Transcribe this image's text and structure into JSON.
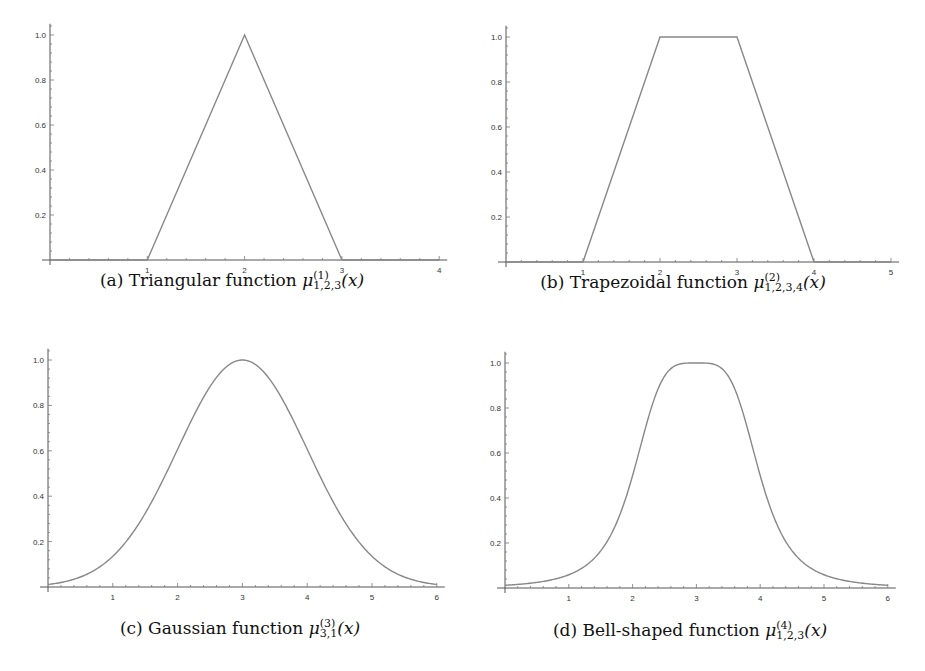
{
  "chart_data": [
    {
      "id": "a",
      "type": "line",
      "title": "Triangular function",
      "caption_prefix": "(a) Triangular function ",
      "sup": "(1)",
      "sub": "1,2,3",
      "arg": "(x)",
      "xlim": [
        0,
        4
      ],
      "ylim": [
        0,
        1.0
      ],
      "xticks": [
        "1",
        "2",
        "3",
        "4"
      ],
      "yticks": [
        "0.2",
        "0.4",
        "0.6",
        "0.8",
        "1.0"
      ],
      "x": [
        0,
        1,
        2,
        3,
        4
      ],
      "values": [
        0,
        0,
        1,
        0,
        0
      ],
      "color": "#888888"
    },
    {
      "id": "b",
      "type": "line",
      "title": "Trapezoidal function",
      "caption_prefix": "(b) Trapezoidal function ",
      "sup": "(2)",
      "sub": "1,2,3,4",
      "arg": "(x)",
      "xlim": [
        0,
        5
      ],
      "ylim": [
        0,
        1.0
      ],
      "xticks": [
        "1",
        "2",
        "3",
        "4",
        "5"
      ],
      "yticks": [
        "0.2",
        "0.4",
        "0.6",
        "0.8",
        "1.0"
      ],
      "x": [
        0,
        1,
        2,
        3,
        4,
        5
      ],
      "values": [
        0,
        0,
        1,
        1,
        0,
        0
      ],
      "color": "#888888"
    },
    {
      "id": "c",
      "type": "line",
      "title": "Gaussian function",
      "caption_prefix": "(c) Gaussian function ",
      "sup": "(3)",
      "sub": "3,1",
      "arg": "(x)",
      "xlim": [
        0,
        6
      ],
      "ylim": [
        0,
        1.0
      ],
      "xticks": [
        "1",
        "2",
        "3",
        "4",
        "5",
        "6"
      ],
      "yticks": [
        "0.2",
        "0.4",
        "0.6",
        "0.8",
        "1.0"
      ],
      "x": [
        0,
        0.5,
        1,
        1.5,
        2,
        2.5,
        3,
        3.5,
        4,
        4.5,
        5,
        5.5,
        6
      ],
      "values": [
        0.011,
        0.044,
        0.135,
        0.325,
        0.607,
        0.882,
        1.0,
        0.882,
        0.607,
        0.325,
        0.135,
        0.044,
        0.011
      ],
      "color": "#888888"
    },
    {
      "id": "d",
      "type": "line",
      "title": "Bell-shaped function",
      "caption_prefix": "(d) Bell-shaped function ",
      "sup": "(4)",
      "sub": "1,2,3",
      "arg": "(x)",
      "xlim": [
        0,
        6
      ],
      "ylim": [
        0,
        1.0
      ],
      "xticks": [
        "1",
        "2",
        "3",
        "4",
        "5",
        "6"
      ],
      "yticks": [
        "0.2",
        "0.4",
        "0.6",
        "0.8",
        "1.0"
      ],
      "x": [
        0,
        0.5,
        1,
        1.5,
        2,
        2.5,
        3,
        3.5,
        4,
        4.5,
        5,
        5.5,
        6
      ],
      "values": [
        0.012,
        0.025,
        0.059,
        0.165,
        0.5,
        0.941,
        1.0,
        0.941,
        0.5,
        0.165,
        0.059,
        0.025,
        0.012
      ],
      "color": "#888888"
    }
  ]
}
